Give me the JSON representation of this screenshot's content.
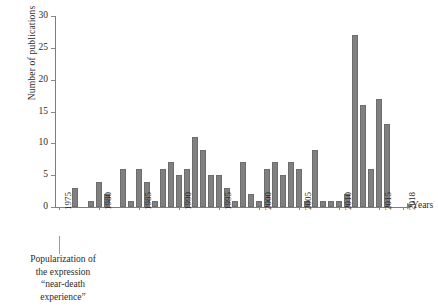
{
  "chart_data": {
    "type": "bar",
    "title": "",
    "xlabel": "Years",
    "ylabel": "Number of publications",
    "ylim": [
      0,
      30
    ],
    "yticks": [
      0,
      5,
      10,
      15,
      20,
      25,
      30
    ],
    "xticks": [
      "1975",
      "1980",
      "1985",
      "1990",
      "1995",
      "2000",
      "2005",
      "2010",
      "2015",
      "2018"
    ],
    "grid": false,
    "legend": null,
    "bar_color": "#808080",
    "axis_color": "#7d7d7d",
    "categories": [
      "1975",
      "1976",
      "1977",
      "1978",
      "1979",
      "1980",
      "1981",
      "1982",
      "1983",
      "1984",
      "1985",
      "1986",
      "1987",
      "1988",
      "1989",
      "1990",
      "1991",
      "1992",
      "1993",
      "1994",
      "1995",
      "1996",
      "1997",
      "1998",
      "1999",
      "2000",
      "2001",
      "2002",
      "2003",
      "2004",
      "2005",
      "2006",
      "2007",
      "2008",
      "2009",
      "2010",
      "2011",
      "2012",
      "2013",
      "2014",
      "2015",
      "2016",
      "2017",
      "2018"
    ],
    "values": [
      0,
      0,
      3,
      0,
      1,
      4,
      2,
      0,
      6,
      1,
      6,
      4,
      1,
      6,
      7,
      5,
      6,
      11,
      9,
      5,
      5,
      3,
      1,
      7,
      2,
      1,
      6,
      7,
      5,
      7,
      6,
      1,
      9,
      1,
      1,
      1,
      2,
      27,
      16,
      6,
      17,
      13,
      0,
      0
    ],
    "annotation": {
      "lines": [
        "Popularization of",
        "the expression",
        "“near-death",
        "experience”"
      ],
      "target_year": "1975"
    }
  }
}
